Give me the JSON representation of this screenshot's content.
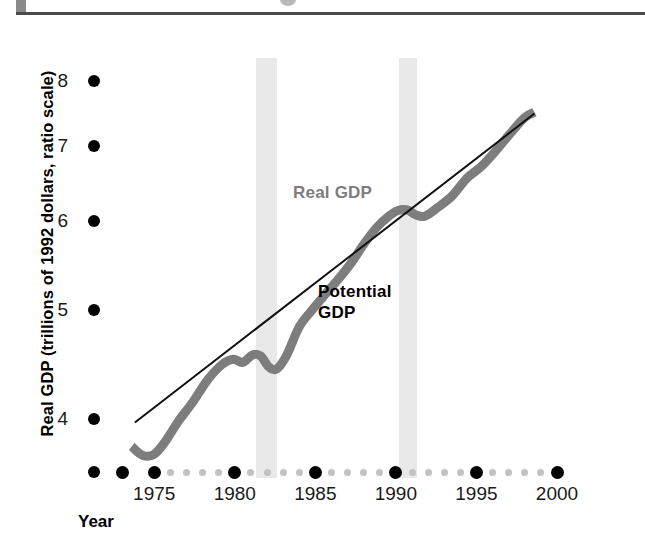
{
  "figure": {
    "background": "#ffffff",
    "width": 645,
    "height": 541
  },
  "header": {
    "rule_color": "#4a4a4a",
    "block_color": "#8a8a8a",
    "dot_color": "#b9b9b9"
  },
  "chart_data": {
    "type": "line",
    "title": "",
    "xlabel": "Year",
    "ylabel": "Real GDP (trillions of 1992 dollars, ratio scale)",
    "yscale": "ratio scale",
    "grid": false,
    "legend_position": "inline-annotation",
    "xlim": [
      1973,
      2000
    ],
    "ylim": [
      3.55,
      8.4
    ],
    "yticks": [
      4,
      5,
      6,
      7,
      8
    ],
    "ytick_labels": [
      "4",
      "5",
      "6",
      "7",
      "8"
    ],
    "xticks": [
      1975,
      1980,
      1985,
      1990,
      1995,
      2000
    ],
    "xtick_labels": [
      "1975",
      "1980",
      "1985",
      "1990",
      "1995",
      "2000"
    ],
    "x_major_dot_years": [
      1973,
      1975,
      1980,
      1985,
      1990,
      1995,
      2000
    ],
    "x_minor_dot_years": [
      1976,
      1977,
      1978,
      1979,
      1981,
      1982,
      1983,
      1984,
      1986,
      1987,
      1988,
      1989,
      1991,
      1992,
      1993,
      1994,
      1996,
      1997,
      1998,
      1999
    ],
    "recession_bands": [
      {
        "label": "recession-band-1",
        "start": 1981.3,
        "end": 1982.6,
        "color": "#e9e9e9"
      },
      {
        "label": "recession-band-2",
        "start": 1990.2,
        "end": 1991.3,
        "color": "#e9e9e9"
      }
    ],
    "series": [
      {
        "name": "Real GDP",
        "color": "#7d7d7d",
        "linewidth": 9,
        "label_text": "Real GDP",
        "x": [
          1973.6,
          1974.3,
          1975.0,
          1975.7,
          1976.5,
          1977.4,
          1978.3,
          1979.2,
          1979.9,
          1980.5,
          1981.1,
          1981.6,
          1982.1,
          1982.6,
          1983.2,
          1984.0,
          1984.8,
          1985.6,
          1986.4,
          1987.2,
          1988.0,
          1988.8,
          1989.5,
          1990.1,
          1990.7,
          1991.2,
          1991.8,
          1992.6,
          1993.5,
          1994.4,
          1995.3,
          1996.2,
          1997.1,
          1998.0,
          1998.6
        ],
        "y": [
          3.78,
          3.71,
          3.72,
          3.82,
          3.98,
          4.14,
          4.33,
          4.47,
          4.52,
          4.49,
          4.56,
          4.55,
          4.45,
          4.43,
          4.55,
          4.83,
          5.0,
          5.16,
          5.32,
          5.5,
          5.72,
          5.92,
          6.05,
          6.13,
          6.14,
          6.08,
          6.06,
          6.17,
          6.32,
          6.55,
          6.71,
          6.93,
          7.18,
          7.42,
          7.5
        ]
      },
      {
        "name": "Potential GDP",
        "color": "#111111",
        "linewidth": 2,
        "label_text": "Potential\nGDP",
        "label_line_1": "Potential",
        "label_line_2": "GDP",
        "x": [
          1973.8,
          1998.6
        ],
        "y": [
          3.97,
          7.48
        ]
      }
    ]
  },
  "annotations": {
    "real_gdp_label": "Real GDP",
    "potential_gdp_label_line1": "Potential",
    "potential_gdp_label_line2": "GDP"
  },
  "axis_title": {
    "x": "Year",
    "y": "Real GDP (trillions of 1992 dollars, ratio scale)"
  }
}
